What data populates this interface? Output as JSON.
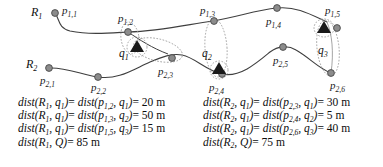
{
  "figure": {
    "colors": {
      "route_line": "#3f3f3f",
      "node_fill": "#8c8c8c",
      "node_stroke": "#4a4a4a",
      "cluster_ellipse": "#9a9a9a",
      "query_marker": "#1a1a1a",
      "text": "#0d0d0d",
      "background": "#ffffff"
    }
  },
  "diagram": {
    "routes": [
      {
        "id": "R1",
        "label": "R",
        "label_sub": "1",
        "nodes": [
          {
            "name": "p",
            "sub": "1,1"
          },
          {
            "name": "p",
            "sub": "1,2"
          },
          {
            "name": "p",
            "sub": "1,3"
          },
          {
            "name": "p",
            "sub": "1,4"
          },
          {
            "name": "p",
            "sub": "1,5"
          }
        ]
      },
      {
        "id": "R2",
        "label": "R",
        "label_sub": "2",
        "nodes": [
          {
            "name": "p",
            "sub": "2,1"
          },
          {
            "name": "p",
            "sub": "2,2"
          },
          {
            "name": "p",
            "sub": "2,3"
          },
          {
            "name": "p",
            "sub": "2,4"
          },
          {
            "name": "p",
            "sub": "2,5"
          },
          {
            "name": "p",
            "sub": "2,6"
          }
        ]
      }
    ],
    "query_points": [
      {
        "name": "q",
        "sub": "1"
      },
      {
        "name": "q",
        "sub": "2"
      },
      {
        "name": "q",
        "sub": "3"
      }
    ]
  },
  "equations": {
    "left": [
      {
        "lhs_fn": "dist",
        "lhs_a": "R",
        "lhs_a_sub": "1",
        "lhs_b": "q",
        "lhs_b_sub": "1",
        "rhs_fn": "dist",
        "rhs_a": "p",
        "rhs_a_sub": "1,2",
        "rhs_b": "q",
        "rhs_b_sub": "1",
        "value": "20",
        "unit": "m"
      },
      {
        "lhs_fn": "dist",
        "lhs_a": "R",
        "lhs_a_sub": "1",
        "lhs_b": "q",
        "lhs_b_sub": "1",
        "rhs_fn": "dist",
        "rhs_a": "p",
        "rhs_a_sub": "1,3",
        "rhs_b": "q",
        "rhs_b_sub": "2",
        "value": "50",
        "unit": "m"
      },
      {
        "lhs_fn": "dist",
        "lhs_a": "R",
        "lhs_a_sub": "1",
        "lhs_b": "q",
        "lhs_b_sub": "1",
        "rhs_fn": "dist",
        "rhs_a": "p",
        "rhs_a_sub": "1,5",
        "rhs_b": "q",
        "rhs_b_sub": "3",
        "value": "15",
        "unit": "m"
      }
    ],
    "left_total": {
      "fn": "dist",
      "a": "R",
      "a_sub": "1",
      "b": "Q",
      "value": "85",
      "unit": "m"
    },
    "right": [
      {
        "lhs_fn": "dist",
        "lhs_a": "R",
        "lhs_a_sub": "2",
        "lhs_b": "q",
        "lhs_b_sub": "1",
        "rhs_fn": "dist",
        "rhs_a": "p",
        "rhs_a_sub": "2,3",
        "rhs_b": "q",
        "rhs_b_sub": "1",
        "value": "30",
        "unit": "m"
      },
      {
        "lhs_fn": "dist",
        "lhs_a": "R",
        "lhs_a_sub": "2",
        "lhs_b": "q",
        "lhs_b_sub": "1",
        "rhs_fn": "dist",
        "rhs_a": "p",
        "rhs_a_sub": "2,4",
        "rhs_b": "q",
        "rhs_b_sub": "2",
        "value": "5",
        "unit": "m"
      },
      {
        "lhs_fn": "dist",
        "lhs_a": "R",
        "lhs_a_sub": "2",
        "lhs_b": "q",
        "lhs_b_sub": "1",
        "rhs_fn": "dist",
        "rhs_a": "p",
        "rhs_a_sub": "2,6",
        "rhs_b": "q",
        "rhs_b_sub": "3",
        "value": "40",
        "unit": "m"
      }
    ],
    "right_total": {
      "fn": "dist",
      "a": "R",
      "a_sub": "2",
      "b": "Q",
      "value": "75",
      "unit": "m"
    }
  }
}
